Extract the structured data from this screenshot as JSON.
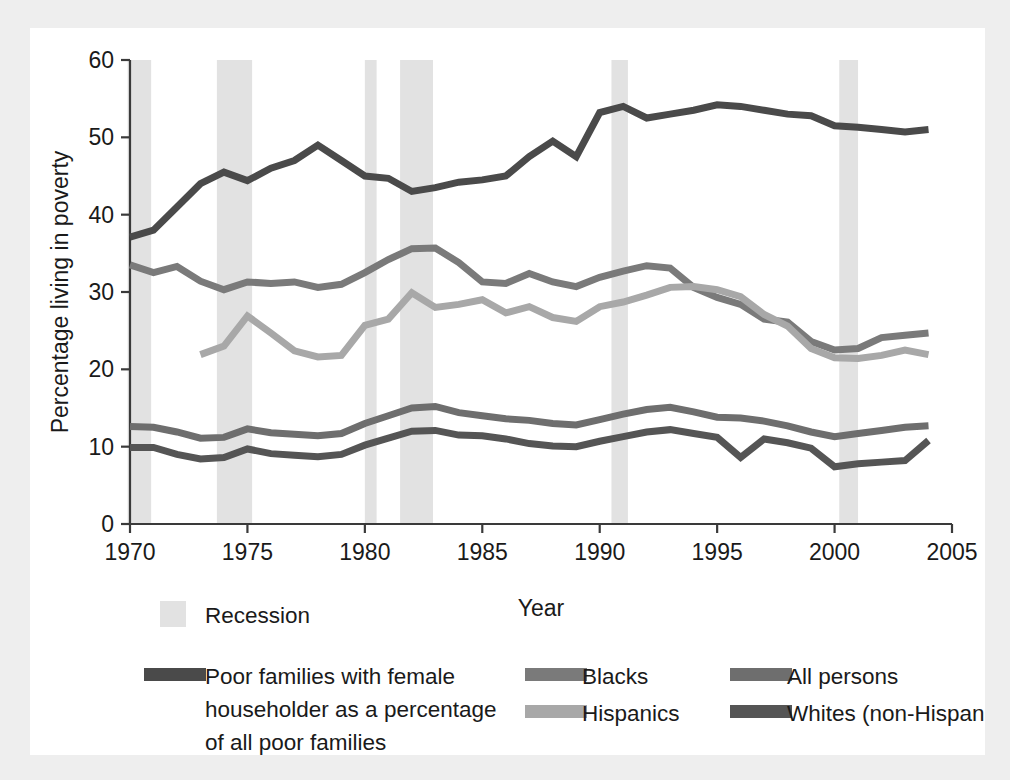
{
  "figure": {
    "background_color": "#eeeeee",
    "card_color": "#ffffff"
  },
  "chart_data": {
    "type": "line",
    "title": "",
    "xlabel": "Year",
    "ylabel": "Percentage living in poverty",
    "xlim": [
      1970,
      2005
    ],
    "ylim": [
      0,
      60
    ],
    "grid": false,
    "legend_position": "below",
    "x_ticks": [
      "1970",
      "1975",
      "1980",
      "1985",
      "1990",
      "1995",
      "2000",
      "2005"
    ],
    "x_tick_values": [
      1970,
      1975,
      1980,
      1985,
      1990,
      1995,
      2000,
      2005
    ],
    "y_ticks": [
      "0",
      "10",
      "20",
      "30",
      "40",
      "50",
      "60"
    ],
    "y_tick_values": [
      0,
      10,
      20,
      30,
      40,
      50,
      60
    ],
    "x": [
      1970,
      1971,
      1972,
      1973,
      1974,
      1975,
      1976,
      1977,
      1978,
      1979,
      1980,
      1981,
      1982,
      1983,
      1984,
      1985,
      1986,
      1987,
      1988,
      1989,
      1990,
      1991,
      1992,
      1993,
      1994,
      1995,
      1996,
      1997,
      1998,
      1999,
      2000,
      2001,
      2002,
      2003,
      2004
    ],
    "series": [
      {
        "name": "Poor families with female householder as a percentage of all poor families",
        "color": "#4a4a4a",
        "width": 7,
        "values": [
          37.1,
          38.0,
          41.0,
          44.0,
          45.5,
          44.4,
          46.0,
          47.0,
          49.0,
          47.0,
          45.0,
          44.7,
          43.0,
          43.5,
          44.2,
          44.5,
          45.0,
          47.5,
          49.5,
          47.5,
          53.2,
          54.0,
          52.5,
          53.0,
          53.5,
          54.2,
          54.0,
          53.5,
          53.0,
          52.8,
          51.5,
          51.3,
          51.0,
          50.7,
          51.0
        ]
      },
      {
        "name": "Blacks",
        "color": "#7a7a7a",
        "width": 7,
        "values": [
          33.5,
          32.5,
          33.3,
          31.4,
          30.3,
          31.3,
          31.1,
          31.3,
          30.6,
          31.0,
          32.5,
          34.2,
          35.6,
          35.7,
          33.8,
          31.3,
          31.1,
          32.4,
          31.3,
          30.7,
          31.9,
          32.7,
          33.4,
          33.1,
          30.6,
          29.3,
          28.4,
          26.5,
          26.1,
          23.6,
          22.5,
          22.7,
          24.1,
          24.4,
          24.7
        ]
      },
      {
        "name": "Hispanics",
        "color": "#a8a8a8",
        "width": 7,
        "values": [
          null,
          null,
          null,
          21.9,
          23.0,
          26.9,
          24.7,
          22.4,
          21.6,
          21.8,
          25.7,
          26.5,
          29.9,
          28.0,
          28.4,
          29.0,
          27.3,
          28.1,
          26.7,
          26.2,
          28.1,
          28.7,
          29.6,
          30.6,
          30.7,
          30.3,
          29.4,
          27.1,
          25.6,
          22.7,
          21.5,
          21.4,
          21.8,
          22.5,
          21.9
        ]
      },
      {
        "name": "All persons",
        "color": "#6e6e6e",
        "width": 7,
        "values": [
          12.6,
          12.5,
          11.9,
          11.1,
          11.2,
          12.3,
          11.8,
          11.6,
          11.4,
          11.7,
          13.0,
          14.0,
          15.0,
          15.2,
          14.4,
          14.0,
          13.6,
          13.4,
          13.0,
          12.8,
          13.5,
          14.2,
          14.8,
          15.1,
          14.5,
          13.8,
          13.7,
          13.3,
          12.7,
          11.9,
          11.3,
          11.7,
          12.1,
          12.5,
          12.7
        ]
      },
      {
        "name": "Whites (non-Hispanic)",
        "color": "#555555",
        "width": 7,
        "values": [
          9.9,
          9.9,
          9.0,
          8.4,
          8.6,
          9.7,
          9.1,
          8.9,
          8.7,
          9.0,
          10.2,
          11.1,
          12.0,
          12.1,
          11.5,
          11.4,
          11.0,
          10.4,
          10.1,
          10.0,
          10.7,
          11.3,
          11.9,
          12.2,
          11.7,
          11.2,
          8.6,
          11.0,
          10.5,
          9.8,
          7.4,
          7.8,
          8.0,
          8.2,
          10.8
        ]
      }
    ],
    "recessions": [
      {
        "start": 1969.9,
        "end": 1970.9
      },
      {
        "start": 1973.7,
        "end": 1975.2
      },
      {
        "start": 1980.0,
        "end": 1980.5
      },
      {
        "start": 1981.5,
        "end": 1982.9
      },
      {
        "start": 1990.5,
        "end": 1991.2
      },
      {
        "start": 2000.2,
        "end": 2001.0
      }
    ],
    "recession_color": "#e2e2e2"
  },
  "legend": {
    "recession_entry": {
      "label": "Recession",
      "swatch_color": "#e2e2e2",
      "swatch_type": "square"
    },
    "entries": [
      {
        "label": "Poor families with female",
        "label_line2": "householder as a percentage",
        "label_line3": "of all poor families",
        "swatch_color": "#4a4a4a"
      },
      {
        "label": "Blacks",
        "swatch_color": "#7a7a7a"
      },
      {
        "label": "Hispanics",
        "swatch_color": "#a8a8a8"
      },
      {
        "label": "All persons",
        "swatch_color": "#6e6e6e"
      },
      {
        "label": "Whites (non-Hispanic)",
        "swatch_color": "#555555"
      }
    ]
  }
}
